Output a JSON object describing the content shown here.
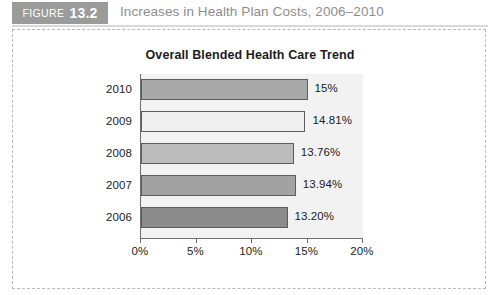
{
  "figure": {
    "badge_word": "FIGURE",
    "badge_number": "13.2",
    "caption": "Increases in Health Plan Costs, 2006–2010",
    "badge_color": "#9b9b9b",
    "caption_color": "#8e8e8e"
  },
  "chart_data": {
    "type": "bar",
    "orientation": "horizontal",
    "title": "Overall Blended Health Care Trend",
    "xlabel": "",
    "ylabel": "",
    "categories": [
      "2010",
      "2009",
      "2008",
      "2007",
      "2006"
    ],
    "values": [
      15,
      14.81,
      13.76,
      13.94,
      13.2
    ],
    "value_labels": [
      "15%",
      "14.81%",
      "13.76%",
      "13.94%",
      "13.20%"
    ],
    "bar_colors": [
      "#a9a9a9",
      "#efefef",
      "#bcbcbc",
      "#a2a2a2",
      "#8b8b8b"
    ],
    "bar_border_color": "#5d5d5d",
    "xlim": [
      0,
      20
    ],
    "xticks": [
      0,
      5,
      10,
      15,
      20
    ],
    "xtick_labels": [
      "0%",
      "5%",
      "10%",
      "15%",
      "20%"
    ],
    "grid": false,
    "legend": false,
    "plot_background": "#f2f2f2"
  }
}
